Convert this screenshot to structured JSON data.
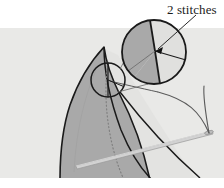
{
  "figure": {
    "title_text": "2 stitches",
    "background_color": "#ffffff",
    "panel_color": "#e9e9e7",
    "fabric_color": "#a9a9a9",
    "fabric_outline_color": "#1a1a1a",
    "seam_line_color": "#8a8a8a",
    "needle_color": "#cfcfcf",
    "needle_outline_color": "#9a9a9a",
    "thread_color": "#5a5a5a",
    "magnifier_fill": "#a9a9a9",
    "magnifier_outline": "#1a1a1a",
    "leader_color": "#3a3a3a",
    "arrow_color": "#111111",
    "panel": {
      "x": 0,
      "y": 28,
      "width": 224,
      "height": 150
    },
    "magnifier_circle": {
      "cx": 154,
      "cy": 52,
      "r": 32
    },
    "detail_circle": {
      "cx": 108,
      "cy": 80,
      "r": 17
    },
    "stitch_convergence_point": {
      "x": 155,
      "y": 51
    },
    "stitch_count": 2,
    "annotations": [
      {
        "name": "callout-label",
        "text": "2 stitches",
        "x": 167,
        "y": 2
      }
    ]
  }
}
